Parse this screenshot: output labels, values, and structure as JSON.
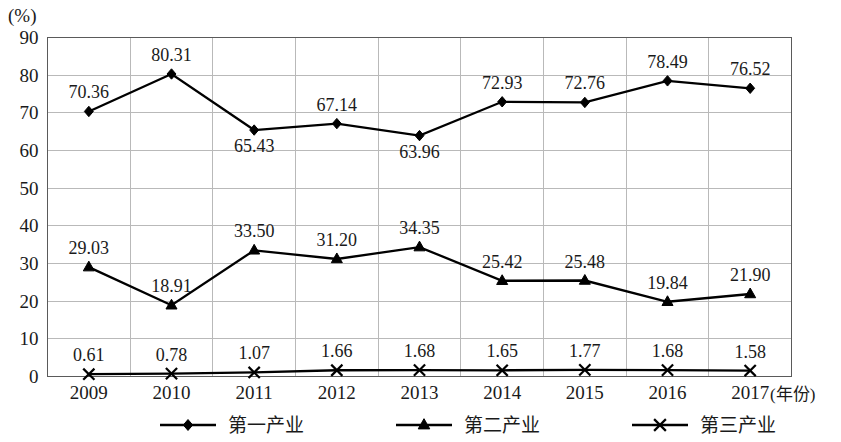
{
  "chart_data": {
    "type": "line",
    "title": "",
    "xlabel": "(年份)",
    "ylabel": "(%)",
    "ylim": [
      0,
      90
    ],
    "ytick_step": 10,
    "grid": true,
    "legend_position": "bottom",
    "categories": [
      "2009",
      "2010",
      "2011",
      "2012",
      "2013",
      "2014",
      "2015",
      "2016",
      "2017"
    ],
    "yticks": [
      "0",
      "10",
      "20",
      "30",
      "40",
      "50",
      "60",
      "70",
      "80",
      "90"
    ],
    "series": [
      {
        "name": "第一产业",
        "marker": "diamond",
        "values": [
          70.36,
          80.31,
          65.43,
          67.14,
          63.96,
          72.93,
          72.76,
          78.49,
          76.52
        ],
        "labels": [
          "70.36",
          "80.31",
          "65.43",
          "67.14",
          "63.96",
          "72.93",
          "72.76",
          "78.49",
          "76.52"
        ],
        "label_positions": [
          "above",
          "above",
          "below",
          "above",
          "below",
          "above",
          "above",
          "above",
          "above"
        ]
      },
      {
        "name": "第二产业",
        "marker": "triangle",
        "values": [
          29.03,
          18.91,
          33.5,
          31.2,
          34.35,
          25.42,
          25.48,
          19.84,
          21.9
        ],
        "labels": [
          "29.03",
          "18.91",
          "33.50",
          "31.20",
          "34.35",
          "25.42",
          "25.48",
          "19.84",
          "21.90"
        ],
        "label_positions": [
          "above",
          "above",
          "above",
          "above",
          "above",
          "above",
          "above",
          "above",
          "above"
        ]
      },
      {
        "name": "第三产业",
        "marker": "cross",
        "values": [
          0.61,
          0.78,
          1.07,
          1.66,
          1.68,
          1.65,
          1.77,
          1.68,
          1.58
        ],
        "labels": [
          "0.61",
          "0.78",
          "1.07",
          "1.66",
          "1.68",
          "1.65",
          "1.77",
          "1.68",
          "1.58"
        ],
        "label_positions": [
          "above",
          "above",
          "above",
          "above",
          "above",
          "above",
          "above",
          "above",
          "above"
        ]
      }
    ],
    "colors": {
      "line": "#000000",
      "grid": "#b9b9b9",
      "border": "#5a5a5a",
      "text": "#1a1a1a",
      "background": "#ffffff"
    }
  },
  "legend": {
    "items": [
      {
        "label": "第一产业",
        "marker": "diamond"
      },
      {
        "label": "第二产业",
        "marker": "triangle"
      },
      {
        "label": "第三产业",
        "marker": "cross"
      }
    ]
  }
}
